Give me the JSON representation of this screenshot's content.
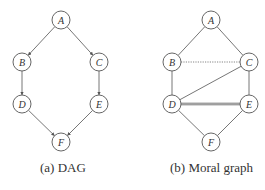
{
  "figure": {
    "panels": [
      {
        "id": "a",
        "caption": "(a) DAG",
        "nodes": [
          {
            "id": "A",
            "label": "A",
            "x": 61,
            "y": 20
          },
          {
            "id": "B",
            "label": "B",
            "x": 22,
            "y": 62
          },
          {
            "id": "C",
            "label": "C",
            "x": 99,
            "y": 62
          },
          {
            "id": "D",
            "label": "D",
            "x": 22,
            "y": 104
          },
          {
            "id": "E",
            "label": "E",
            "x": 99,
            "y": 104
          },
          {
            "id": "F",
            "label": "F",
            "x": 61,
            "y": 142
          }
        ],
        "edges": [
          {
            "from": "A",
            "to": "B",
            "directed": true
          },
          {
            "from": "A",
            "to": "C",
            "directed": true
          },
          {
            "from": "B",
            "to": "D",
            "directed": true
          },
          {
            "from": "C",
            "to": "E",
            "directed": true
          },
          {
            "from": "D",
            "to": "F",
            "directed": true
          },
          {
            "from": "E",
            "to": "F",
            "directed": true
          }
        ]
      },
      {
        "id": "b",
        "caption": "(b) Moral graph",
        "nodes": [
          {
            "id": "A",
            "label": "A",
            "x": 211,
            "y": 20
          },
          {
            "id": "B",
            "label": "B",
            "x": 172,
            "y": 62
          },
          {
            "id": "C",
            "label": "C",
            "x": 249,
            "y": 62
          },
          {
            "id": "D",
            "label": "D",
            "x": 172,
            "y": 104
          },
          {
            "id": "E",
            "label": "E",
            "x": 249,
            "y": 104
          },
          {
            "id": "F",
            "label": "F",
            "x": 211,
            "y": 142
          }
        ],
        "edges": [
          {
            "from": "A",
            "to": "B",
            "directed": false,
            "style": "solid"
          },
          {
            "from": "A",
            "to": "C",
            "directed": false,
            "style": "solid"
          },
          {
            "from": "B",
            "to": "C",
            "directed": false,
            "style": "dotted"
          },
          {
            "from": "B",
            "to": "D",
            "directed": false,
            "style": "solid"
          },
          {
            "from": "C",
            "to": "D",
            "directed": false,
            "style": "solid"
          },
          {
            "from": "C",
            "to": "E",
            "directed": false,
            "style": "solid"
          },
          {
            "from": "D",
            "to": "E",
            "directed": false,
            "style": "double"
          },
          {
            "from": "D",
            "to": "F",
            "directed": false,
            "style": "solid"
          },
          {
            "from": "E",
            "to": "F",
            "directed": false,
            "style": "solid"
          }
        ]
      }
    ],
    "colors": {
      "stroke": "#666666",
      "text": "#333333",
      "background": "#ffffff"
    }
  }
}
